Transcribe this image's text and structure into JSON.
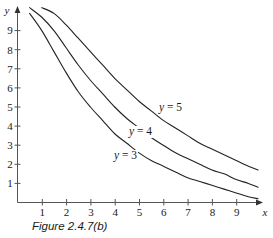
{
  "figure": {
    "caption": "Figure 2.4.7(b)",
    "x_axis_name": "x",
    "y_axis_name": "y"
  },
  "curve_labels": {
    "top": "y = 5",
    "middle": "y = 4",
    "bottom": "y = 3"
  },
  "curve_label_parts": {
    "top_var": "y",
    "top_rest": " = 5",
    "middle_var": "y",
    "middle_rest": " = 4",
    "bottom_var": "y",
    "bottom_rest": " = 3"
  },
  "ticks": {
    "x": [
      "1",
      "2",
      "3",
      "4",
      "5",
      "6",
      "7",
      "8",
      "9"
    ],
    "y": [
      "1",
      "2",
      "3",
      "4",
      "5",
      "6",
      "7",
      "8",
      "9"
    ]
  },
  "colors": {
    "curve": "#222222",
    "axis": "#555555",
    "text": "#1a1a1a",
    "background": "#ffffff"
  },
  "chart_data": {
    "type": "line",
    "title": "Figure 2.4.7(b)",
    "xlabel": "x",
    "ylabel": "y",
    "xlim": [
      0,
      10
    ],
    "ylim": [
      0,
      10
    ],
    "grid": false,
    "legend": "inline-curve-labels",
    "annotations": [
      "y = 5",
      "y = 4",
      "y = 3"
    ],
    "x": [
      0.2,
      0.5,
      1,
      1.5,
      2,
      2.5,
      3,
      3.5,
      4,
      4.5,
      5,
      5.5,
      6,
      6.5,
      7,
      7.5,
      8,
      8.5,
      9,
      9.5,
      9.9
    ],
    "series": [
      {
        "name": "y = 5",
        "values": [
          10.5,
          10.4,
          10.2,
          9.9,
          9.3,
          8.6,
          7.9,
          7.2,
          6.5,
          5.9,
          5.3,
          4.8,
          4.3,
          3.9,
          3.5,
          3.1,
          2.8,
          2.5,
          2.2,
          1.9,
          1.7
        ]
      },
      {
        "name": "y = 4",
        "values": [
          10.4,
          10.2,
          9.7,
          9.0,
          8.1,
          7.2,
          6.4,
          5.7,
          5.0,
          4.4,
          3.9,
          3.4,
          3.0,
          2.6,
          2.3,
          2.0,
          1.7,
          1.5,
          1.2,
          1.0,
          0.8
        ]
      },
      {
        "name": "y = 3",
        "values": [
          10.3,
          9.9,
          9.0,
          7.9,
          6.8,
          5.8,
          5.0,
          4.3,
          3.6,
          3.1,
          2.6,
          2.2,
          1.9,
          1.6,
          1.3,
          1.1,
          0.9,
          0.7,
          0.5,
          0.3,
          0.2
        ]
      }
    ]
  }
}
